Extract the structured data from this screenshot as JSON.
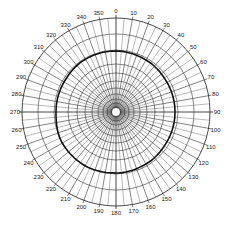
{
  "chart_data": {
    "type": "polar",
    "title": "",
    "center": [
      116,
      112
    ],
    "outer_radius": 94,
    "angular_ticks": [
      "0",
      "10",
      "20",
      "30",
      "40",
      "50",
      "60",
      "70",
      "80",
      "90",
      "100",
      "110",
      "120",
      "130",
      "140",
      "150",
      "160",
      "170",
      "180",
      "190",
      "200",
      "210",
      "220",
      "230",
      "240",
      "250",
      "260",
      "270",
      "280",
      "290",
      "300",
      "310",
      "320",
      "330",
      "340",
      "350"
    ],
    "angular_direction": "clockwise",
    "zero_location": "top",
    "radial_spokes_every_deg": 5,
    "ring_radii_px": [
      5,
      9,
      13,
      18,
      24,
      31,
      39,
      48,
      62,
      78,
      94
    ],
    "grid": true,
    "series": [
      {
        "name": "pattern",
        "angles_deg": [
          0,
          30,
          60,
          90,
          120,
          150,
          180,
          210,
          240,
          270,
          300,
          330,
          360
        ],
        "radius_px": [
          61,
          60,
          59,
          59,
          59,
          60,
          61,
          62,
          62,
          60,
          60,
          61,
          61
        ],
        "color": "#111111",
        "line_width": 1.6
      }
    ],
    "colors": {
      "grid": "#333333",
      "curve": "#111111",
      "background": "#ffffff"
    }
  }
}
